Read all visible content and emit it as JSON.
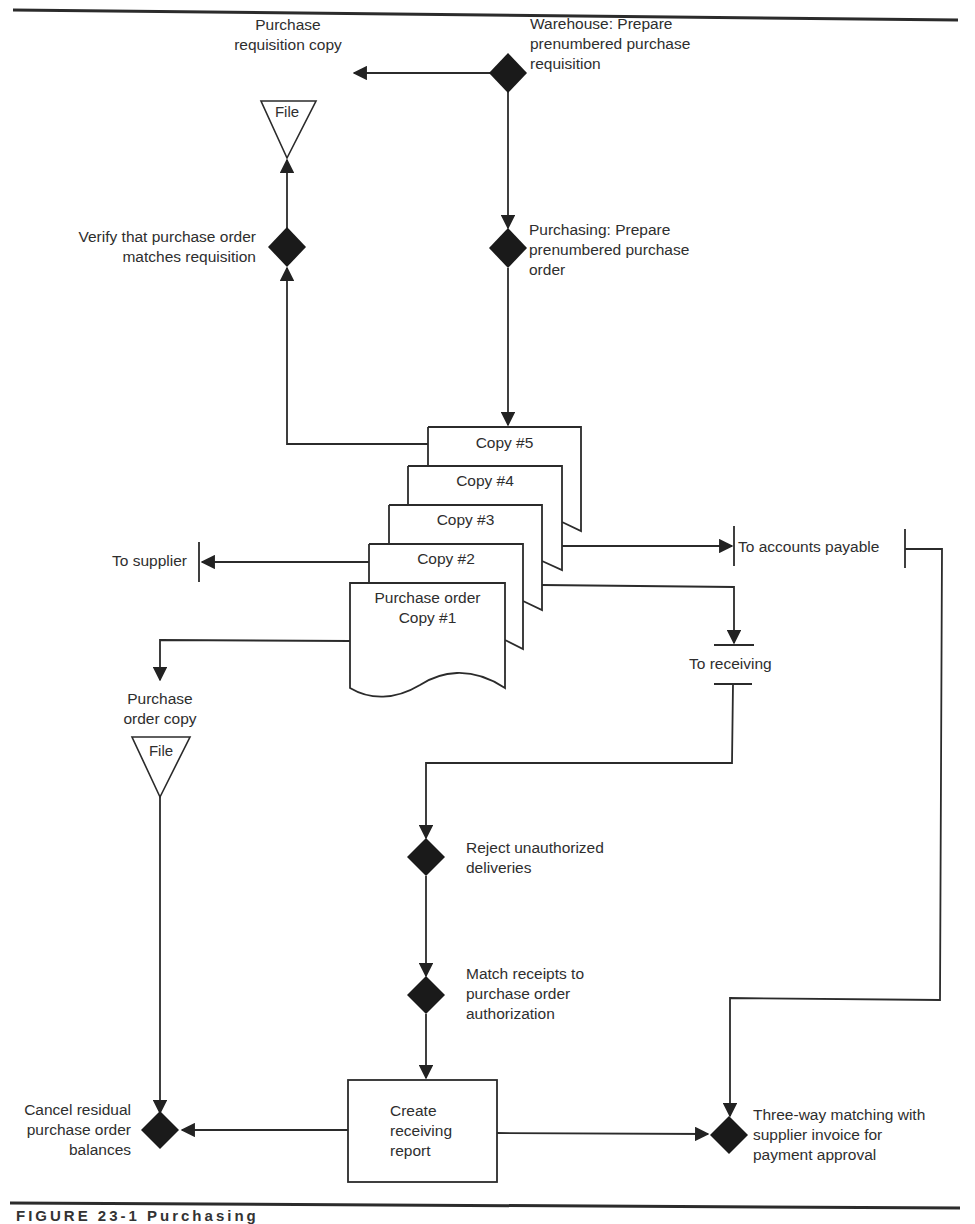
{
  "diagram": {
    "type": "flowchart",
    "title_rule": true,
    "nodes": {
      "warehouse": {
        "kind": "control-diamond",
        "lines": [
          "Warehouse: Prepare",
          "prenumbered purchase",
          "requisition"
        ]
      },
      "req_copy": {
        "kind": "file",
        "lines": [
          "Purchase",
          "requisition copy"
        ],
        "file_label": "File"
      },
      "verify": {
        "kind": "control-diamond",
        "lines": [
          "Verify that purchase order",
          "matches requisition"
        ]
      },
      "purchasing": {
        "kind": "control-diamond",
        "lines": [
          "Purchasing: Prepare",
          "prenumbered purchase",
          "order"
        ]
      },
      "copies": [
        {
          "label": "Copy #5"
        },
        {
          "label": "Copy #4"
        },
        {
          "label": "Copy #3"
        },
        {
          "label": "Copy #2"
        },
        {
          "label_lines": [
            "Purchase order",
            "Copy #1"
          ]
        }
      ],
      "to_supplier": {
        "kind": "off-page",
        "label": "To supplier"
      },
      "to_ap": {
        "kind": "off-page",
        "label": "To accounts payable"
      },
      "to_receiving": {
        "kind": "off-page",
        "label": "To receiving"
      },
      "po_copy": {
        "kind": "file",
        "lines": [
          "Purchase",
          "order copy"
        ],
        "file_label": "File"
      },
      "reject": {
        "kind": "control-diamond",
        "lines": [
          "Reject unauthorized",
          "deliveries"
        ]
      },
      "match": {
        "kind": "control-diamond",
        "lines": [
          "Match receipts to",
          "purchase order",
          "authorization"
        ]
      },
      "receiving_report": {
        "kind": "process",
        "lines": [
          "Create",
          "receiving",
          "report"
        ]
      },
      "cancel": {
        "kind": "control-diamond",
        "lines": [
          "Cancel residual",
          "purchase order",
          "balances"
        ]
      },
      "three_way": {
        "kind": "control-diamond",
        "lines": [
          "Three-way matching with",
          "supplier invoice for",
          "payment approval"
        ]
      }
    },
    "caption": "FIGURE 23-1 Purchasing"
  },
  "colors": {
    "line": "#2b2b2b",
    "diamond": "#1a1a1a",
    "background": "#ffffff"
  }
}
